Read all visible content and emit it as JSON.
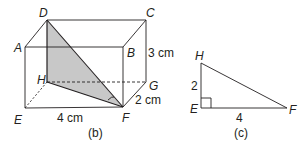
{
  "figure_b": {
    "caption": "(b)",
    "vertices": {
      "A": "A",
      "B": "B",
      "C": "C",
      "D": "D",
      "E": "E",
      "F": "F",
      "G": "G",
      "H": "H"
    },
    "dimensions": {
      "height": "3 cm",
      "depth": "2 cm",
      "length": "4 cm"
    },
    "shaded_triangle": "DHF",
    "shade_color": "#c8c8c8",
    "line_color": "#231f20"
  },
  "figure_c": {
    "caption": "(c)",
    "vertices": {
      "H": "H",
      "E": "E",
      "F": "F"
    },
    "sides": {
      "HE": "2",
      "EF": "4"
    },
    "right_angle_at": "E"
  }
}
